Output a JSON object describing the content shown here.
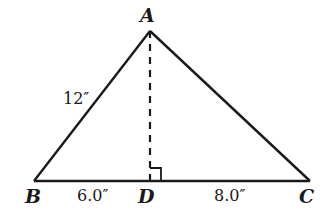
{
  "diagram": {
    "type": "triangle",
    "vertices": {
      "A": {
        "label": "A"
      },
      "B": {
        "label": "B"
      },
      "C": {
        "label": "C"
      },
      "D": {
        "label": "D"
      }
    },
    "measurements": {
      "AB": "12″",
      "BD": "6.0″",
      "DC": "8.0″"
    },
    "annotations": {
      "altitude": "AD dashed",
      "right_angle": "at D"
    },
    "colors": {
      "stroke": "#1a1a1a",
      "background": "#ffffff"
    }
  }
}
